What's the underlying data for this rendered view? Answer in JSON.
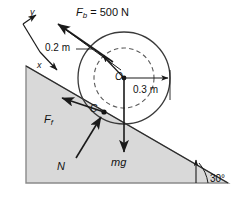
{
  "figure": {
    "background_color": "#ffffff",
    "stroke_color": "#1a1a1a",
    "incline_fill": "#d9d9d9",
    "incline_stroke": "#808080"
  },
  "labels": {
    "applied_force": {
      "symbol": "F",
      "subscript": "b",
      "equals": "= 500 N",
      "full": "F_b = 500 N"
    },
    "inner_radius": "0.2 m",
    "outer_radius": "0.3 m",
    "center_point": "O",
    "contact_point": "C",
    "friction_force": {
      "symbol": "F",
      "subscript": "f",
      "full": "F_f"
    },
    "normal_force": "N",
    "weight": "mg",
    "incline_angle": "30°",
    "axis_x": "x",
    "axis_y": "y"
  },
  "diagram_data": {
    "type": "free-body-diagram",
    "incline_angle_deg": 30,
    "wheel": {
      "outer_radius_m": 0.3,
      "inner_radius_m": 0.2,
      "center_label": "O",
      "contact_label": "C",
      "outer_circle_style": "solid",
      "inner_circle_style": "dashed"
    },
    "forces": [
      {
        "name": "applied cord force",
        "label": "F_b = 500 N",
        "magnitude": 500,
        "unit": "N",
        "direction": "up the incline, to the upper left",
        "applied_at": "inner radius 0.2 m"
      },
      {
        "name": "friction force",
        "label": "F_f",
        "direction": "up the incline, to the upper left",
        "applied_at": "contact point C"
      },
      {
        "name": "normal force",
        "label": "N",
        "direction": "perpendicular to incline surface, upward",
        "applied_at": "contact point C"
      },
      {
        "name": "weight",
        "label": "mg",
        "direction": "vertically downward",
        "applied_at": "center O"
      }
    ],
    "coordinate_axes": {
      "x": "down the incline to the right",
      "y": "perpendicular to incline, upward",
      "rotation_deg": 30
    }
  }
}
